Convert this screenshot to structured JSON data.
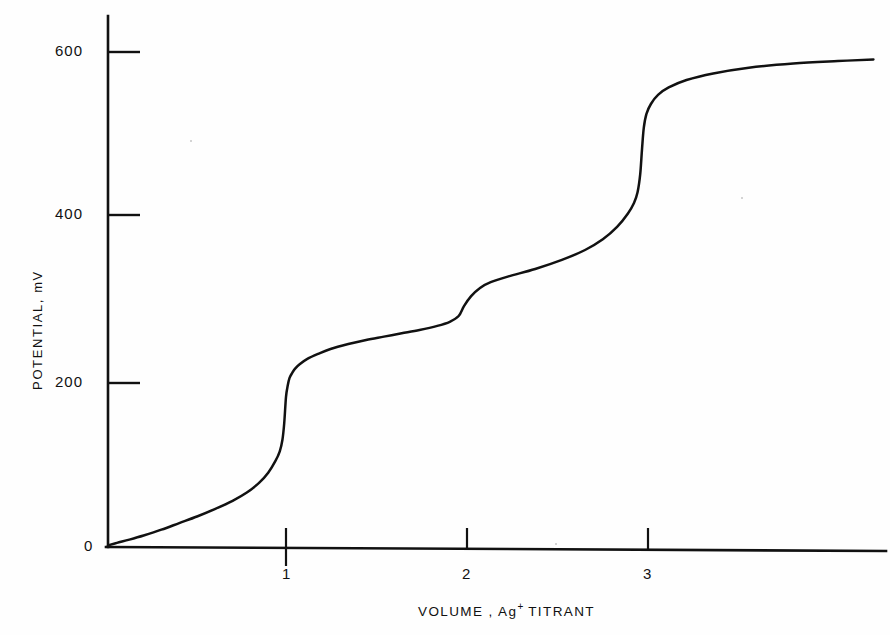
{
  "figure": {
    "background_color": "#fefefe",
    "line_color": "#111111",
    "axis_color": "#111111"
  },
  "axes": {
    "y_title": "POTENTIAL, mV",
    "x_title_main": "VOLUME , Ag",
    "x_title_sup": "+",
    "x_title_tail": " TITRANT",
    "y_ticks": [
      "0",
      "200",
      "400",
      "600"
    ],
    "x_ticks": [
      "1",
      "2",
      "3"
    ]
  },
  "chart_data": {
    "type": "line",
    "title": "",
    "subtitle": "",
    "xlabel": "VOLUME , Ag+ TITRANT",
    "ylabel": "POTENTIAL, mV",
    "xlim": [
      0,
      4.3
    ],
    "ylim": [
      0,
      660
    ],
    "xticks": [
      1,
      2,
      3
    ],
    "yticks": [
      0,
      200,
      400,
      600
    ],
    "grid": false,
    "legend": null,
    "annotations": [],
    "series": [
      {
        "name": "Potential vs volume of Ag+ titrant",
        "x": [
          0.0,
          0.05,
          0.12,
          0.2,
          0.3,
          0.4,
          0.5,
          0.6,
          0.7,
          0.78,
          0.85,
          0.9,
          0.94,
          0.965,
          0.98,
          0.99,
          1.0,
          1.01,
          1.02,
          1.035,
          1.05,
          1.08,
          1.12,
          1.18,
          1.25,
          1.35,
          1.45,
          1.55,
          1.65,
          1.75,
          1.85,
          1.92,
          1.97,
          2.0,
          2.04,
          2.09,
          2.15,
          2.25,
          2.4,
          2.55,
          2.68,
          2.78,
          2.86,
          2.92,
          2.955,
          2.975,
          2.99,
          3.0,
          3.01,
          3.025,
          3.05,
          3.09,
          3.15,
          3.25,
          3.4,
          3.6,
          3.85,
          4.1,
          4.3
        ],
        "y": [
          2,
          5,
          9,
          14,
          21,
          29,
          37,
          46,
          56,
          66,
          78,
          90,
          104,
          116,
          130,
          150,
          182,
          196,
          205,
          211,
          216,
          222,
          228,
          234,
          240,
          246,
          251,
          255,
          259,
          263,
          268,
          273,
          280,
          292,
          304,
          314,
          321,
          328,
          337,
          348,
          360,
          373,
          388,
          404,
          417,
          430,
          452,
          482,
          508,
          525,
          537,
          548,
          557,
          566,
          574,
          581,
          586,
          589,
          591
        ]
      }
    ]
  },
  "tick_positions": {
    "x_axis_y_px": 547,
    "y_axis_x_px": 108,
    "x_px": {
      "1": 286,
      "2": 467,
      "3": 648
    },
    "y_px": {
      "0": 547,
      "200": 383,
      "400": 215,
      "600": 52
    }
  }
}
